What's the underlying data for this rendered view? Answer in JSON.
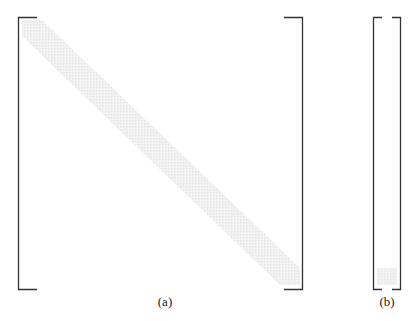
{
  "figure": {
    "panels": [
      {
        "id": "a",
        "label": "(a)",
        "description": "square matrix with banded diagonal"
      },
      {
        "id": "b",
        "label": "(b)",
        "description": "column vector with entries near bottom"
      }
    ],
    "colors": {
      "bracket": "#333333",
      "band": "#e6e6e6",
      "background": "#ffffff"
    }
  }
}
